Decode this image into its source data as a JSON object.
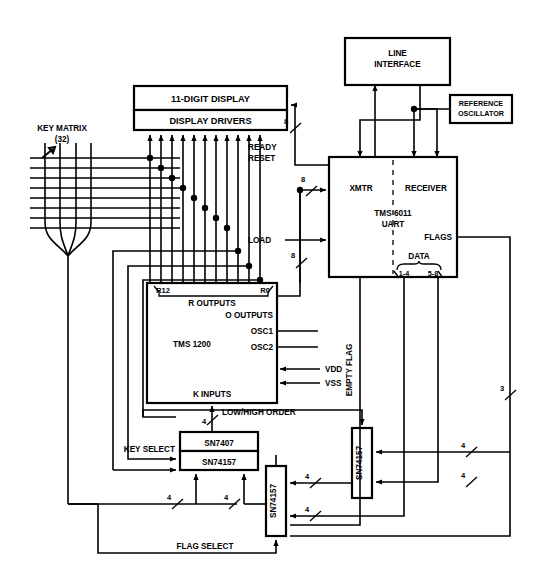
{
  "diagram": {
    "type": "block-diagram",
    "canvas": {
      "width": 541,
      "height": 578
    },
    "colors": {
      "line": "#000000",
      "fill": "#ffffff",
      "background": "#ffffff"
    }
  },
  "blocks": {
    "display_top": {
      "label": "11-DIGIT DISPLAY",
      "x": 134,
      "y": 86,
      "w": 153,
      "h": 24
    },
    "display_drivers": {
      "label": "DISPLAY DRIVERS",
      "x": 134,
      "y": 110,
      "w": 153,
      "h": 20
    },
    "line_interface": {
      "label_line1": "LINE",
      "label_line2": "INTERFACE",
      "x": 345,
      "y": 38,
      "w": 105,
      "h": 47
    },
    "reference_oscillator": {
      "label_line1": "REFERENCE",
      "label_line2": "OSCILLATOR",
      "x": 450,
      "y": 95,
      "w": 62,
      "h": 28
    },
    "uart": {
      "x": 329,
      "y": 157,
      "w": 128,
      "h": 120,
      "xmtr": "XMTR",
      "receiver": "RECEIVER",
      "part_line1": "TMS 6011",
      "part_line2": "UART",
      "flags": "FLAGS",
      "data": "DATA",
      "data_low": "1-4",
      "data_high": "5-8"
    },
    "tms1200": {
      "x": 147,
      "y": 283,
      "w": 130,
      "h": 120,
      "part": "TMS 1200",
      "r12": "R12",
      "r0": "R0",
      "r_outputs": "R OUTPUTS",
      "o_outputs": "O OUTPUTS",
      "osc1": "OSC1",
      "osc2": "OSC2",
      "k_inputs": "K INPUTS"
    },
    "sn7407": {
      "label": "SN7407",
      "x": 180,
      "y": 432,
      "w": 78,
      "h": 19
    },
    "sn74157_a": {
      "label": "SN74157",
      "x": 180,
      "y": 451,
      "w": 78,
      "h": 19
    },
    "sn74157_b": {
      "label": "SN74157",
      "x": 266,
      "y": 466,
      "w": 20,
      "h": 70
    },
    "sn74157_c": {
      "label": "SN74157",
      "x": 352,
      "y": 428,
      "w": 20,
      "h": 70
    }
  },
  "labels": {
    "key_matrix_line1": "KEY MATRIX",
    "key_matrix_line2": "(32)",
    "ready": "READY",
    "reset": "RESET",
    "load": "LOAD",
    "vdd": "VDD",
    "vss": "VSS",
    "low_high_order": "LOW/HIGH ORDER",
    "key_select": "KEY SELECT",
    "flag_select": "FLAG SELECT",
    "empty_flag": "EMPTY FLAG"
  },
  "bus_widths": {
    "display_bus": "8",
    "xmtr_bus": "8",
    "load_bus": "8",
    "k_inputs_bus": "4",
    "low_high_bus": "4",
    "key_select_a_bus": "4",
    "key_select_b_bus": "4",
    "mux_b_in1": "4",
    "mux_b_in2": "4",
    "mux_c_in1": "4",
    "mux_c_in2": "4",
    "flags_bus": "3"
  },
  "counts": {
    "display_driver_arrows": 11,
    "key_matrix_rows": 8,
    "key_matrix_cols": 4
  }
}
